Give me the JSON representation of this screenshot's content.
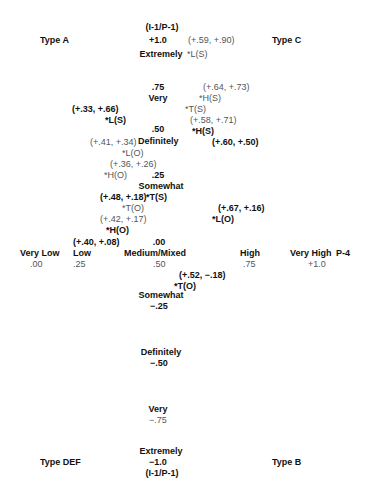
{
  "corners": {
    "top_left": "Type A",
    "top_right": "Type C",
    "bottom_left": "Type DEF",
    "bottom_right": "Type B"
  },
  "vertical_axis": {
    "top_label": "(I-1/P-1)",
    "bottom_label": "(I-1/P-1)",
    "ticks": [
      {
        "value": "+1.0",
        "label": "Extremely"
      },
      {
        "value": ".75",
        "label": "Very"
      },
      {
        "value": ".50",
        "label": "Definitely"
      },
      {
        "value": ".25",
        "label": "Somewhat"
      },
      {
        "value": ".00",
        "label": ""
      },
      {
        "value": "−.25",
        "label": "Somewhat"
      },
      {
        "value": "−.50",
        "label": "Definitely"
      },
      {
        "value": "−.75",
        "label": "Very"
      },
      {
        "value": "−1.0",
        "label": "Extremely"
      }
    ]
  },
  "horizontal_axis": {
    "axis_label": "P-4",
    "ticks": [
      {
        "label": "Very Low",
        "value": ".00"
      },
      {
        "label": "Low",
        "value": ".25"
      },
      {
        "label": "Medium/Mixed",
        "value": ".50"
      },
      {
        "label": "High",
        "value": ".75"
      },
      {
        "label": "Very High",
        "value": "+1.0"
      }
    ]
  },
  "points": [
    {
      "coord": "(+.59, +.90)",
      "label": "*L(S)",
      "bold": false
    },
    {
      "coord": "(+.64, +.73)",
      "label": "*H(S)",
      "bold": false
    },
    {
      "coord": "(+.33, +.66)",
      "label": "*L(S)",
      "bold": true
    },
    {
      "coord": "",
      "label": "*T(S)",
      "bold": false
    },
    {
      "coord": "(+.58, +.71)",
      "label": "*H(S)",
      "bold": true
    },
    {
      "coord": "(+.60, +.50)",
      "label": "",
      "bold": true
    },
    {
      "coord": "(+.41, +.34)",
      "label": "*L(O)",
      "bold": false
    },
    {
      "coord": "(+.36, +.26)",
      "label": "*H(O)",
      "bold": false
    },
    {
      "coord": "(+.48, +.18)",
      "label": "*T(S)",
      "bold": true
    },
    {
      "coord": "",
      "label": "*T(O)",
      "bold": false
    },
    {
      "coord": "(+.42, +.17)",
      "label": "*H(O)",
      "bold": true
    },
    {
      "coord": "(+.67, +.16)",
      "label": "*L(O)",
      "bold": true
    },
    {
      "coord": "(+.40, +.08)",
      "label": "",
      "bold": true
    },
    {
      "coord": "(+.52, −.18)",
      "label": "*T(O)",
      "bold": true
    }
  ]
}
